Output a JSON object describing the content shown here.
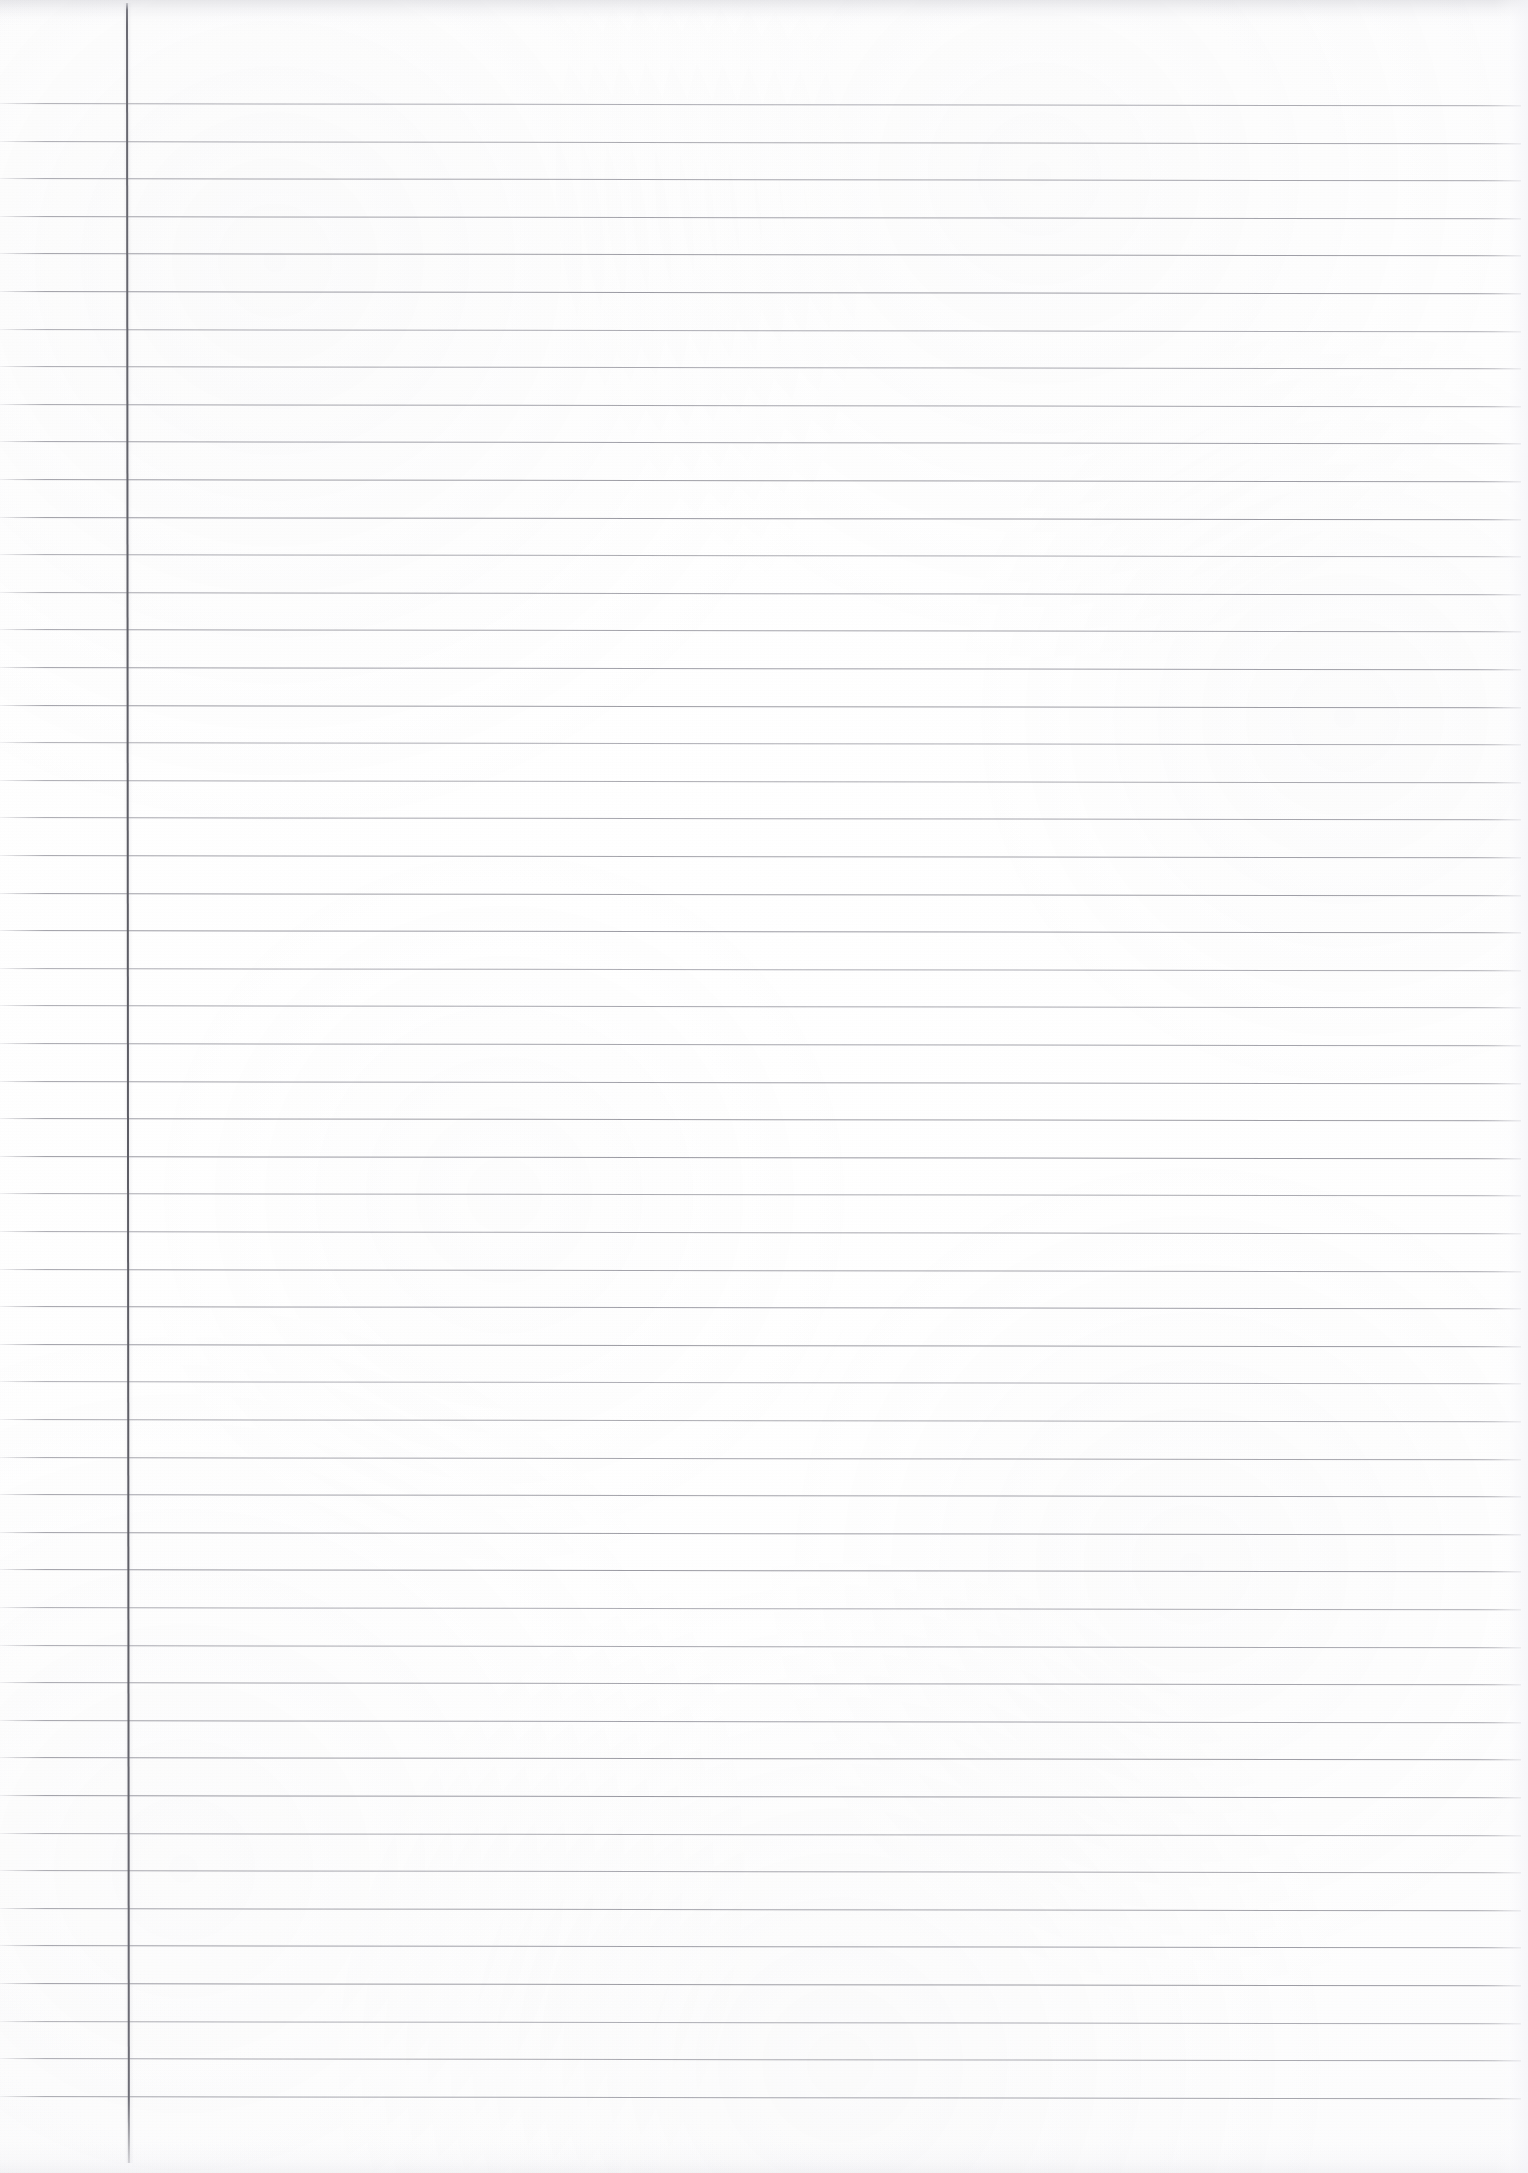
{
  "document": {
    "kind": "scanned-ruled-paper",
    "title": "Blank Lined Notebook Page",
    "content_text": "",
    "page_width": 1528,
    "page_height": 2173
  },
  "paper": {
    "background_color": "#fefefe",
    "tint_color": "#f6f6f8",
    "has_visible_text": false,
    "has_handwriting": false,
    "orientation": "portrait"
  },
  "ruling": {
    "style": "wide-ruled-single-margin",
    "horizontal_line_color": "#9a9aa2",
    "horizontal_line_thickness_px": 1,
    "line_spacing_px": 37.6,
    "first_line_y": 103,
    "last_line_y": 2088,
    "line_count": 54,
    "line_start_x": 0,
    "line_end_x": 1521,
    "skew_degrees": 0.085
  },
  "margin_rule": {
    "color": "#5c5c64",
    "thickness_px": 2,
    "x": 126,
    "top_y": 3,
    "bottom_y": 2163,
    "label": "vertical-margin-line"
  },
  "scan_artifacts": {
    "top_edge_band": "#b0b0ba",
    "bottom_edge_band": "#c4c4ce",
    "right_edge_falloff": "#f4f4f8",
    "vignette": true,
    "grain": true
  }
}
